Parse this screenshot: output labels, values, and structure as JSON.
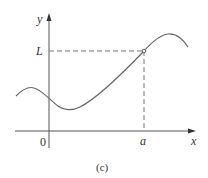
{
  "figure": {
    "caption": "(c)",
    "labels": {
      "y_axis": "y",
      "x_axis": "x",
      "origin": "0",
      "limit_value": "L",
      "approach_point": "a"
    },
    "colors": {
      "axes": "#555555",
      "curve": "#666666",
      "dashed": "#777777",
      "text": "#333333"
    }
  }
}
